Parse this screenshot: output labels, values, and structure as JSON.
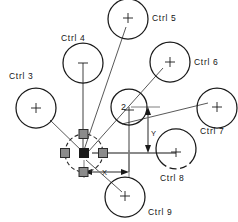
{
  "diagram": {
    "type": "cad-control-handle-diagram",
    "title": "",
    "canvas": {
      "width": 238,
      "height": 222
    },
    "origin": {
      "x": 84,
      "y": 153
    },
    "node_label": "2",
    "dimensions": [
      {
        "name": "x-dimension",
        "label": "X",
        "orientation": "horizontal",
        "label_x": 104,
        "label_y": 176,
        "from_x": 84,
        "to_x": 130,
        "line_y": 172
      },
      {
        "name": "y-dimension",
        "label": "Y",
        "orientation": "vertical",
        "label_x": 151,
        "label_y": 133,
        "from_y": 107,
        "to_y": 153,
        "line_x": 148
      }
    ],
    "controls": [
      {
        "id": "ctrl-3",
        "label": "Ctrl 3",
        "label_x": 9,
        "label_y": 79,
        "cx": 36,
        "cy": 108,
        "r": 20,
        "dashed": false,
        "marker": "cross",
        "leader_to_x": 84,
        "leader_to_y": 153
      },
      {
        "id": "ctrl-4",
        "label": "Ctrl 4",
        "label_x": 61,
        "label_y": 41,
        "cx": 83,
        "cy": 63,
        "r": 20,
        "dashed": false,
        "marker": "vstem",
        "leader_to_x": 84,
        "leader_to_y": 153
      },
      {
        "id": "ctrl-5",
        "label": "Ctrl 5",
        "label_x": 152,
        "label_y": 20,
        "cx": 128,
        "cy": 19,
        "r": 20,
        "dashed": false,
        "marker": "cross",
        "leader_to_x": 84,
        "leader_to_y": 150
      },
      {
        "id": "ctrl-6",
        "label": "Ctrl 6",
        "label_x": 194,
        "label_y": 64,
        "cx": 170,
        "cy": 62,
        "r": 20,
        "dashed": false,
        "marker": "cross",
        "leader_to_x": 88,
        "leader_to_y": 152
      },
      {
        "id": "ctrl-7",
        "label": "Ctrl 7",
        "label_x": 200,
        "label_y": 132,
        "cx": 217,
        "cy": 108,
        "r": 20,
        "dashed": false,
        "marker": "cross",
        "leader_to_x": 90,
        "leader_to_y": 151
      },
      {
        "id": "ctrl-8",
        "label": "Ctrl 8",
        "label_x": 160,
        "label_y": 178,
        "cx": 176,
        "cy": 152,
        "r": 20,
        "dashed": true,
        "marker": "cross",
        "leader_to_x": 92,
        "leader_to_y": 153
      },
      {
        "id": "ctrl-9",
        "label": "Ctrl 9",
        "label_x": 148,
        "label_y": 213,
        "cx": 125,
        "cy": 197,
        "r": 20,
        "dashed": false,
        "marker": "cross",
        "leader_to_x": 86,
        "leader_to_y": 160
      },
      {
        "id": "node-2",
        "label": "2",
        "label_x": 122,
        "label_y": 108,
        "cx": 129,
        "cy": 107,
        "r": 18,
        "dashed": false,
        "marker": "vstem",
        "leader_to_x": 0,
        "leader_to_y": 0
      }
    ],
    "hub": {
      "name": "selection-hub",
      "cx": 84,
      "cy": 153,
      "radius": 19,
      "handles": [
        {
          "name": "handle-top",
          "x": 84,
          "y": 134
        },
        {
          "name": "handle-bottom",
          "x": 84,
          "y": 172
        },
        {
          "name": "handle-left",
          "x": 65,
          "y": 153
        },
        {
          "name": "handle-right",
          "x": 103,
          "y": 153
        },
        {
          "name": "handle-center",
          "x": 84,
          "y": 153
        }
      ]
    },
    "colors": {
      "stroke": "#1a1a1a",
      "leader": "#3a3a3a",
      "handle_fill": "#8b8b8b",
      "handle_center": "#1a1a1a",
      "dimension": "#6f6f6f",
      "background": "#ffffff"
    }
  }
}
